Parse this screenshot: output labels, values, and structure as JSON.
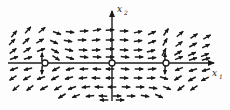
{
  "figure": {
    "background_color": "#fdfdfd",
    "ink_color": "#1a1a1a",
    "width": 230,
    "height": 110
  },
  "axes": {
    "x_axis": {
      "label": "x",
      "subscript": "1",
      "label_full": "x₁",
      "y_pixel": 63,
      "x_start": 8,
      "x_end": 214,
      "arrow_end": "right"
    },
    "y_axis": {
      "label": "x",
      "subscript": "2",
      "label_full": "x₂",
      "x_pixel": 112,
      "y_start": 101,
      "y_end": 11,
      "arrow_end": "up"
    }
  },
  "equilibria": [
    {
      "name": "left-equilibrium",
      "cx": 45,
      "cy": 63,
      "r": 3,
      "marker": "open-circle"
    },
    {
      "name": "origin-equilibrium",
      "cx": 112,
      "cy": 63,
      "r": 3,
      "marker": "open-circle"
    },
    {
      "name": "right-equilibrium",
      "cx": 166,
      "cy": 63,
      "r": 3,
      "marker": "open-circle"
    }
  ],
  "chart_data": {
    "type": "scatter",
    "xlabel": "x₁",
    "ylabel": "x₂",
    "grid": false,
    "legend": "none",
    "xlim": [
      8,
      214
    ],
    "ylim": [
      11,
      101
    ],
    "equilibrium_x": [
      45,
      112,
      166
    ],
    "equilibrium_y": [
      0,
      0,
      0
    ],
    "vectors": [
      {
        "x": 14,
        "y": 34,
        "angle": -50
      },
      {
        "x": 28,
        "y": 30,
        "angle": -48
      },
      {
        "x": 42,
        "y": 30,
        "angle": -40
      },
      {
        "x": 57,
        "y": 33,
        "angle": 20
      },
      {
        "x": 70,
        "y": 32,
        "angle": 8
      },
      {
        "x": 84,
        "y": 31,
        "angle": -3
      },
      {
        "x": 97,
        "y": 30,
        "angle": -12
      },
      {
        "x": 110,
        "y": 30,
        "angle": -4
      },
      {
        "x": 124,
        "y": 31,
        "angle": 0
      },
      {
        "x": 138,
        "y": 32,
        "angle": -12
      },
      {
        "x": 152,
        "y": 33,
        "angle": -24
      },
      {
        "x": 166,
        "y": 32,
        "angle": -55
      },
      {
        "x": 180,
        "y": 34,
        "angle": -40
      },
      {
        "x": 194,
        "y": 36,
        "angle": -34
      },
      {
        "x": 207,
        "y": 37,
        "angle": -30
      },
      {
        "x": 12,
        "y": 42,
        "angle": -46
      },
      {
        "x": 26,
        "y": 41,
        "angle": -42
      },
      {
        "x": 40,
        "y": 41,
        "angle": -30
      },
      {
        "x": 54,
        "y": 42,
        "angle": 24
      },
      {
        "x": 68,
        "y": 41,
        "angle": 10
      },
      {
        "x": 82,
        "y": 40,
        "angle": 0
      },
      {
        "x": 96,
        "y": 40,
        "angle": -6
      },
      {
        "x": 110,
        "y": 40,
        "angle": 0
      },
      {
        "x": 124,
        "y": 40,
        "angle": 2
      },
      {
        "x": 138,
        "y": 41,
        "angle": -8
      },
      {
        "x": 152,
        "y": 42,
        "angle": -20
      },
      {
        "x": 165,
        "y": 42,
        "angle": -60
      },
      {
        "x": 179,
        "y": 44,
        "angle": -36
      },
      {
        "x": 193,
        "y": 45,
        "angle": -28
      },
      {
        "x": 206,
        "y": 46,
        "angle": -26
      },
      {
        "x": 13,
        "y": 51,
        "angle": -38
      },
      {
        "x": 27,
        "y": 50,
        "angle": -34
      },
      {
        "x": 41,
        "y": 50,
        "angle": -20
      },
      {
        "x": 55,
        "y": 51,
        "angle": 28
      },
      {
        "x": 69,
        "y": 50,
        "angle": 14
      },
      {
        "x": 83,
        "y": 50,
        "angle": 4
      },
      {
        "x": 96,
        "y": 50,
        "angle": -2
      },
      {
        "x": 110,
        "y": 49,
        "angle": 0
      },
      {
        "x": 124,
        "y": 50,
        "angle": 4
      },
      {
        "x": 138,
        "y": 50,
        "angle": -4
      },
      {
        "x": 151,
        "y": 51,
        "angle": -14
      },
      {
        "x": 164,
        "y": 52,
        "angle": -62
      },
      {
        "x": 178,
        "y": 53,
        "angle": -32
      },
      {
        "x": 192,
        "y": 54,
        "angle": -24
      },
      {
        "x": 205,
        "y": 55,
        "angle": -22
      },
      {
        "x": 14,
        "y": 58,
        "angle": -20
      },
      {
        "x": 28,
        "y": 58,
        "angle": -16
      },
      {
        "x": 42,
        "y": 57,
        "angle": -88
      },
      {
        "x": 56,
        "y": 58,
        "angle": 34
      },
      {
        "x": 70,
        "y": 58,
        "angle": 18
      },
      {
        "x": 84,
        "y": 57,
        "angle": 8
      },
      {
        "x": 97,
        "y": 57,
        "angle": 2
      },
      {
        "x": 110,
        "y": 57,
        "angle": 0
      },
      {
        "x": 125,
        "y": 57,
        "angle": 6
      },
      {
        "x": 139,
        "y": 57,
        "angle": 0
      },
      {
        "x": 152,
        "y": 58,
        "angle": -8
      },
      {
        "x": 165,
        "y": 57,
        "angle": -88
      },
      {
        "x": 179,
        "y": 58,
        "angle": -22
      },
      {
        "x": 193,
        "y": 59,
        "angle": -18
      },
      {
        "x": 206,
        "y": 59,
        "angle": -16
      },
      {
        "x": 14,
        "y": 69,
        "angle": 160
      },
      {
        "x": 28,
        "y": 69,
        "angle": 166
      },
      {
        "x": 42,
        "y": 70,
        "angle": 92
      },
      {
        "x": 56,
        "y": 69,
        "angle": 152
      },
      {
        "x": 70,
        "y": 69,
        "angle": 166
      },
      {
        "x": 84,
        "y": 69,
        "angle": 176
      },
      {
        "x": 97,
        "y": 69,
        "angle": 182
      },
      {
        "x": 110,
        "y": 69,
        "angle": 180
      },
      {
        "x": 125,
        "y": 69,
        "angle": 6
      },
      {
        "x": 139,
        "y": 69,
        "angle": 0
      },
      {
        "x": 152,
        "y": 69,
        "angle": -6
      },
      {
        "x": 165,
        "y": 70,
        "angle": 92
      },
      {
        "x": 179,
        "y": 69,
        "angle": 158
      },
      {
        "x": 193,
        "y": 70,
        "angle": 162
      },
      {
        "x": 206,
        "y": 70,
        "angle": 164
      },
      {
        "x": 13,
        "y": 78,
        "angle": 146
      },
      {
        "x": 27,
        "y": 78,
        "angle": 150
      },
      {
        "x": 41,
        "y": 78,
        "angle": 160
      },
      {
        "x": 55,
        "y": 78,
        "angle": 152
      },
      {
        "x": 69,
        "y": 78,
        "angle": 164
      },
      {
        "x": 83,
        "y": 78,
        "angle": 174
      },
      {
        "x": 96,
        "y": 78,
        "angle": 182
      },
      {
        "x": 110,
        "y": 78,
        "angle": 180
      },
      {
        "x": 124,
        "y": 78,
        "angle": 4
      },
      {
        "x": 138,
        "y": 78,
        "angle": 0
      },
      {
        "x": 151,
        "y": 78,
        "angle": -4
      },
      {
        "x": 164,
        "y": 78,
        "angle": 18
      },
      {
        "x": 178,
        "y": 78,
        "angle": 148
      },
      {
        "x": 192,
        "y": 79,
        "angle": 152
      },
      {
        "x": 205,
        "y": 79,
        "angle": 154
      },
      {
        "x": 16,
        "y": 88,
        "angle": 140
      },
      {
        "x": 30,
        "y": 88,
        "angle": 142
      },
      {
        "x": 44,
        "y": 88,
        "angle": 152
      },
      {
        "x": 58,
        "y": 88,
        "angle": 150
      },
      {
        "x": 72,
        "y": 88,
        "angle": 160
      },
      {
        "x": 86,
        "y": 87,
        "angle": 172
      },
      {
        "x": 99,
        "y": 87,
        "angle": 182
      },
      {
        "x": 112,
        "y": 87,
        "angle": 180
      },
      {
        "x": 126,
        "y": 87,
        "angle": 2
      },
      {
        "x": 140,
        "y": 87,
        "angle": 0
      },
      {
        "x": 153,
        "y": 88,
        "angle": 8
      },
      {
        "x": 167,
        "y": 88,
        "angle": 22
      },
      {
        "x": 181,
        "y": 88,
        "angle": 142
      },
      {
        "x": 194,
        "y": 88,
        "angle": 146
      },
      {
        "x": 62,
        "y": 96,
        "angle": 148
      },
      {
        "x": 76,
        "y": 96,
        "angle": 158
      },
      {
        "x": 90,
        "y": 96,
        "angle": 172
      },
      {
        "x": 103,
        "y": 96,
        "angle": 182
      },
      {
        "x": 117,
        "y": 96,
        "angle": 0
      },
      {
        "x": 131,
        "y": 96,
        "angle": 0
      },
      {
        "x": 145,
        "y": 96,
        "angle": 10
      },
      {
        "x": 159,
        "y": 96,
        "angle": 24
      },
      {
        "x": 104,
        "y": 100,
        "angle": 180
      },
      {
        "x": 120,
        "y": 100,
        "angle": 0
      }
    ]
  }
}
